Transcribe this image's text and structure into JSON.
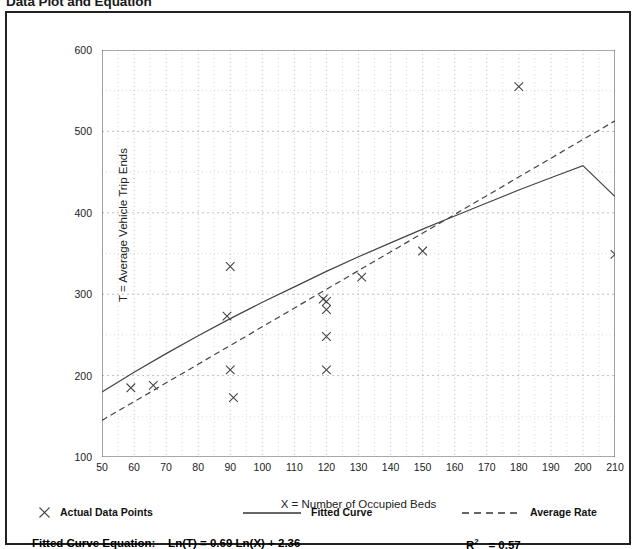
{
  "page": {
    "title": "Data Plot and Equation"
  },
  "legend": [
    {
      "name": "actual-data-points",
      "label": "Actual Data Points",
      "marker": "x-marker",
      "color": "#444444"
    },
    {
      "name": "fitted-curve",
      "label": "Fitted Curve",
      "marker": "solid-line",
      "color": "#444444"
    },
    {
      "name": "average-rate",
      "label": "Average Rate",
      "marker": "dashed-line",
      "color": "#444444"
    }
  ],
  "equation": {
    "label": "Fitted Curve Equation:",
    "formula": "Ln(T) = 0.69 Ln(X) + 2.36",
    "r_squared_label": "R",
    "r_squared_exponent": "2",
    "r_squared_value": "= 0.57"
  },
  "chart_data": {
    "type": "scatter",
    "title": "Data Plot and Equation",
    "xlabel": "X = Number of Occupied Beds",
    "ylabel": "T = Average Vehicle Trip Ends",
    "xlim": [
      50,
      210
    ],
    "ylim": [
      100,
      600
    ],
    "xticks": [
      50,
      60,
      70,
      80,
      90,
      100,
      110,
      120,
      130,
      140,
      150,
      160,
      170,
      180,
      190,
      200,
      210
    ],
    "yticks": [
      100,
      200,
      300,
      400,
      500,
      600
    ],
    "xminor_step": 5,
    "yminor_step": 50,
    "grid": true,
    "grid_style": "dotted",
    "legend_position": "below-plot",
    "series": [
      {
        "name": "Actual Data Points",
        "type": "scatter",
        "marker": "x",
        "color": "#444444",
        "points": [
          {
            "x": 59,
            "y": 185
          },
          {
            "x": 66,
            "y": 188
          },
          {
            "x": 89,
            "y": 273
          },
          {
            "x": 90,
            "y": 334
          },
          {
            "x": 90,
            "y": 207
          },
          {
            "x": 91,
            "y": 173
          },
          {
            "x": 119,
            "y": 294
          },
          {
            "x": 120,
            "y": 291
          },
          {
            "x": 120,
            "y": 281
          },
          {
            "x": 120,
            "y": 248
          },
          {
            "x": 120,
            "y": 207
          },
          {
            "x": 131,
            "y": 321
          },
          {
            "x": 150,
            "y": 353
          },
          {
            "x": 180,
            "y": 555
          },
          {
            "x": 210,
            "y": 349
          }
        ]
      },
      {
        "name": "Fitted Curve",
        "type": "line",
        "style": "solid",
        "color": "#444444",
        "equation": "Ln(T) = 0.69 Ln(X) + 2.36",
        "r_squared": 0.57,
        "points": [
          {
            "x": 50,
            "y": 180
          },
          {
            "x": 60,
            "y": 204
          },
          {
            "x": 70,
            "y": 227
          },
          {
            "x": 80,
            "y": 249
          },
          {
            "x": 90,
            "y": 270
          },
          {
            "x": 100,
            "y": 290
          },
          {
            "x": 110,
            "y": 309
          },
          {
            "x": 120,
            "y": 328
          },
          {
            "x": 130,
            "y": 346
          },
          {
            "x": 140,
            "y": 363
          },
          {
            "x": 150,
            "y": 380
          },
          {
            "x": 160,
            "y": 396
          },
          {
            "x": 170,
            "y": 412
          },
          {
            "x": 180,
            "y": 428
          },
          {
            "x": 190,
            "y": 443
          },
          {
            "x": 200,
            "y": 458
          },
          {
            "x": 210,
            "y": 420
          }
        ]
      },
      {
        "name": "Average Rate",
        "type": "line",
        "style": "dashed",
        "color": "#444444",
        "points": [
          {
            "x": 50,
            "y": 145
          },
          {
            "x": 210,
            "y": 513
          }
        ]
      }
    ]
  }
}
